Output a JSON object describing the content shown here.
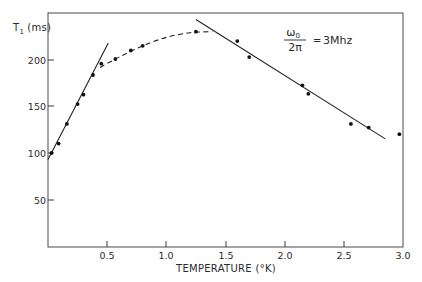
{
  "chart_data": {
    "type": "scatter",
    "title": "",
    "xlabel": "TEMPERATURE (°K)",
    "ylabel": "T₁ (ms)",
    "xlim": [
      0,
      3.0
    ],
    "ylim": [
      0,
      250
    ],
    "x_ticks": [
      0.5,
      1.0,
      1.5,
      2.0,
      2.5,
      3.0
    ],
    "x_tick_labels": [
      "0.5",
      "1.0",
      "1.5",
      "2.0",
      "2.5",
      "3.0"
    ],
    "y_ticks": [
      50,
      100,
      150,
      200
    ],
    "y_tick_labels": [
      "50",
      "100",
      "150",
      "200"
    ],
    "grid": false,
    "legend": null,
    "annotation": {
      "numerator": "ω₀",
      "denominator": "2π",
      "equals": "= 3 Mhz"
    },
    "series": [
      {
        "name": "measured",
        "style": "points",
        "x": [
          0.03,
          0.09,
          0.16,
          0.25,
          0.3,
          0.38,
          0.45,
          0.57,
          0.7,
          0.8,
          1.25,
          1.6,
          1.7,
          2.15,
          2.2,
          2.56,
          2.71,
          2.97
        ],
        "y": [
          100,
          110,
          131,
          152,
          162,
          183,
          195,
          200,
          209,
          214,
          229,
          219,
          202,
          172,
          163,
          131,
          127,
          120
        ]
      },
      {
        "name": "low-T linear fit",
        "style": "solid-line",
        "x": [
          0.0,
          0.51
        ],
        "y": [
          93,
          217
        ]
      },
      {
        "name": "transition (dashed)",
        "style": "dashed-curve",
        "x": [
          0.44,
          0.6,
          0.8,
          1.0,
          1.2,
          1.39
        ],
        "y": [
          191,
          202,
          214,
          223,
          228,
          229
        ]
      },
      {
        "name": "high-T linear fit",
        "style": "solid-line",
        "x": [
          1.25,
          2.85
        ],
        "y": [
          242,
          115
        ]
      }
    ]
  },
  "axes": {
    "y_title_main": "T",
    "y_title_sub": "1",
    "y_title_unit": "(ms)",
    "x_title": "TEMPERATURE (°K)",
    "x_ticks": [
      "0.5",
      "1.0",
      "1.5",
      "2.0",
      "2.5",
      "3.0"
    ],
    "y_ticks": [
      "50",
      "100",
      "150",
      "200"
    ]
  },
  "annotation": {
    "numerator": "ω",
    "numerator_sub": "0",
    "denominator": "2π",
    "equals": "=",
    "value": "3Mhz"
  }
}
